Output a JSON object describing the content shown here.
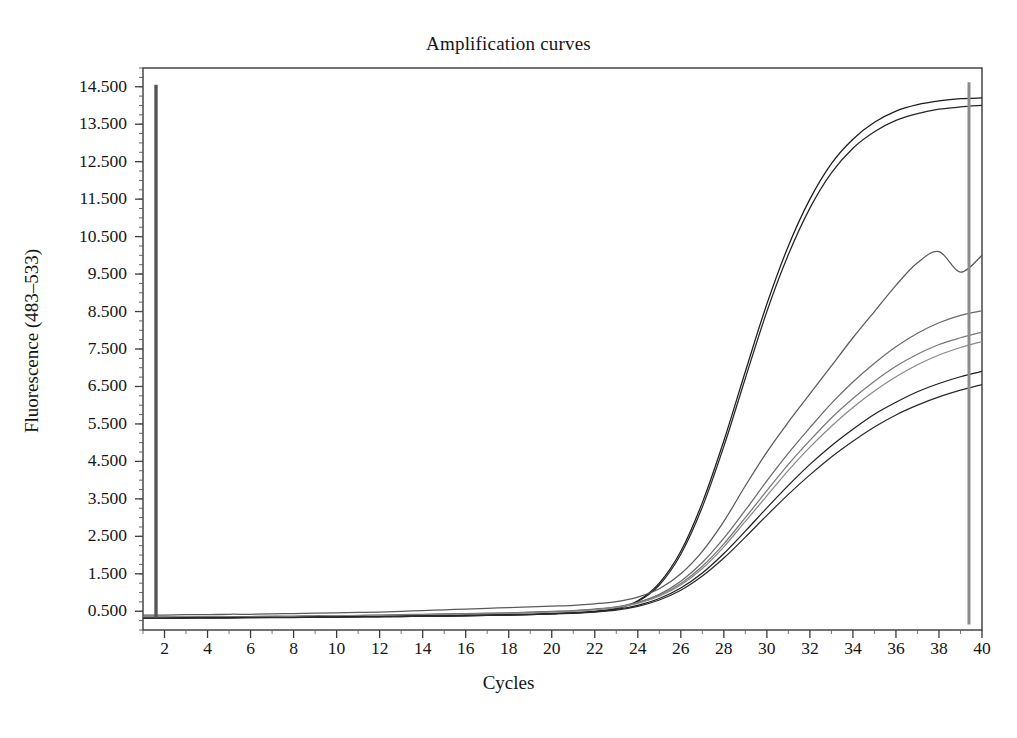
{
  "chart_data": {
    "type": "line",
    "title": "Amplification curves",
    "xlabel": "Cycles",
    "ylabel": "Fluorescence (483–533)",
    "xlim": [
      1,
      40
    ],
    "ylim": [
      0,
      15.0
    ],
    "grid": false,
    "legend": null,
    "legend_position": "none",
    "x_tick_labels": [
      "2",
      "4",
      "6",
      "8",
      "10",
      "12",
      "14",
      "16",
      "18",
      "20",
      "22",
      "24",
      "26",
      "28",
      "30",
      "32",
      "34",
      "36",
      "38",
      "40"
    ],
    "x_ticks": [
      2,
      4,
      6,
      8,
      10,
      12,
      14,
      16,
      18,
      20,
      22,
      24,
      26,
      28,
      30,
      32,
      34,
      36,
      38,
      40
    ],
    "x_minor_step": 1,
    "y_tick_labels": [
      "0.500",
      "1.500",
      "2.500",
      "3.500",
      "4.500",
      "5.500",
      "6.500",
      "7.500",
      "8.500",
      "9.500",
      "10.500",
      "11.500",
      "12.500",
      "13.500",
      "14.500"
    ],
    "y_ticks": [
      0.5,
      1.5,
      2.5,
      3.5,
      4.5,
      5.5,
      6.5,
      7.5,
      8.5,
      9.5,
      10.5,
      11.5,
      12.5,
      13.5,
      14.5
    ],
    "y_minor_step": 0.25,
    "x": [
      1,
      2,
      3,
      4,
      5,
      6,
      7,
      8,
      9,
      10,
      11,
      12,
      13,
      14,
      15,
      16,
      17,
      18,
      19,
      20,
      21,
      22,
      23,
      24,
      25,
      26,
      27,
      28,
      29,
      30,
      31,
      32,
      33,
      34,
      35,
      36,
      37,
      38,
      39,
      40
    ],
    "series": [
      {
        "name": "curve-1",
        "color": "#1c1c1c",
        "values": [
          0.33,
          0.33,
          0.33,
          0.33,
          0.34,
          0.34,
          0.34,
          0.35,
          0.35,
          0.36,
          0.36,
          0.37,
          0.37,
          0.38,
          0.38,
          0.39,
          0.4,
          0.41,
          0.42,
          0.44,
          0.46,
          0.5,
          0.58,
          0.78,
          1.25,
          2.1,
          3.4,
          5.05,
          6.9,
          8.7,
          10.25,
          11.5,
          12.45,
          13.1,
          13.55,
          13.85,
          14.02,
          14.12,
          14.18,
          14.2
        ]
      },
      {
        "name": "curve-2",
        "color": "#262626",
        "values": [
          0.32,
          0.32,
          0.32,
          0.33,
          0.33,
          0.33,
          0.34,
          0.34,
          0.34,
          0.35,
          0.35,
          0.36,
          0.36,
          0.37,
          0.37,
          0.38,
          0.39,
          0.4,
          0.41,
          0.43,
          0.45,
          0.49,
          0.57,
          0.76,
          1.2,
          2.02,
          3.28,
          4.9,
          6.72,
          8.5,
          10.02,
          11.26,
          12.2,
          12.86,
          13.3,
          13.6,
          13.78,
          13.9,
          13.96,
          14.0
        ]
      },
      {
        "name": "curve-3",
        "color": "#5a5a5a",
        "values": [
          0.4,
          0.4,
          0.41,
          0.41,
          0.42,
          0.42,
          0.43,
          0.44,
          0.45,
          0.46,
          0.47,
          0.48,
          0.5,
          0.52,
          0.54,
          0.56,
          0.58,
          0.6,
          0.62,
          0.64,
          0.66,
          0.7,
          0.76,
          0.88,
          1.1,
          1.5,
          2.1,
          2.9,
          3.85,
          4.75,
          5.55,
          6.3,
          7.05,
          7.8,
          8.5,
          9.2,
          9.8,
          10.1,
          9.55,
          10.0
        ]
      },
      {
        "name": "curve-4",
        "color": "#6a6a6a",
        "values": [
          0.35,
          0.35,
          0.35,
          0.36,
          0.36,
          0.36,
          0.37,
          0.37,
          0.38,
          0.38,
          0.39,
          0.4,
          0.41,
          0.42,
          0.43,
          0.44,
          0.45,
          0.46,
          0.48,
          0.5,
          0.52,
          0.56,
          0.62,
          0.74,
          0.95,
          1.3,
          1.8,
          2.45,
          3.2,
          3.98,
          4.72,
          5.4,
          6.05,
          6.62,
          7.12,
          7.56,
          7.92,
          8.2,
          8.4,
          8.52
        ]
      },
      {
        "name": "curve-5",
        "color": "#787878",
        "values": [
          0.34,
          0.34,
          0.34,
          0.35,
          0.35,
          0.35,
          0.36,
          0.36,
          0.37,
          0.37,
          0.38,
          0.39,
          0.4,
          0.41,
          0.42,
          0.43,
          0.44,
          0.45,
          0.47,
          0.49,
          0.51,
          0.55,
          0.61,
          0.72,
          0.92,
          1.24,
          1.7,
          2.3,
          3.0,
          3.72,
          4.42,
          5.06,
          5.66,
          6.18,
          6.64,
          7.04,
          7.36,
          7.62,
          7.8,
          7.95
        ]
      },
      {
        "name": "curve-6",
        "color": "#8a8a8a",
        "values": [
          0.33,
          0.33,
          0.34,
          0.34,
          0.34,
          0.35,
          0.35,
          0.36,
          0.36,
          0.37,
          0.38,
          0.38,
          0.39,
          0.4,
          0.41,
          0.42,
          0.43,
          0.44,
          0.46,
          0.48,
          0.5,
          0.54,
          0.6,
          0.71,
          0.9,
          1.2,
          1.64,
          2.22,
          2.9,
          3.58,
          4.26,
          4.88,
          5.44,
          5.94,
          6.38,
          6.76,
          7.08,
          7.34,
          7.54,
          7.7
        ]
      },
      {
        "name": "curve-7",
        "color": "#1f1f1f",
        "values": [
          0.32,
          0.32,
          0.33,
          0.33,
          0.33,
          0.34,
          0.34,
          0.34,
          0.35,
          0.35,
          0.36,
          0.36,
          0.37,
          0.38,
          0.38,
          0.39,
          0.4,
          0.41,
          0.42,
          0.44,
          0.46,
          0.49,
          0.55,
          0.66,
          0.84,
          1.12,
          1.52,
          2.04,
          2.64,
          3.26,
          3.86,
          4.42,
          4.92,
          5.36,
          5.76,
          6.08,
          6.36,
          6.58,
          6.76,
          6.9
        ]
      },
      {
        "name": "curve-8",
        "color": "#2b2b2b",
        "values": [
          0.31,
          0.31,
          0.32,
          0.32,
          0.32,
          0.33,
          0.33,
          0.33,
          0.34,
          0.34,
          0.35,
          0.35,
          0.36,
          0.37,
          0.37,
          0.38,
          0.39,
          0.4,
          0.41,
          0.43,
          0.45,
          0.48,
          0.53,
          0.63,
          0.8,
          1.06,
          1.44,
          1.92,
          2.48,
          3.06,
          3.62,
          4.14,
          4.62,
          5.04,
          5.42,
          5.74,
          6.0,
          6.22,
          6.4,
          6.55
        ]
      }
    ],
    "annotations": [
      {
        "name": "cycle-1-marker",
        "type": "vertical-line",
        "x": 1,
        "y_from": 0.33,
        "y_to": 14.55,
        "color": "#555555"
      },
      {
        "name": "cycle-40-marker",
        "type": "vertical-line",
        "x": 40,
        "y_from": 0.15,
        "y_to": 14.62,
        "color": "#8c8c8c"
      }
    ]
  }
}
